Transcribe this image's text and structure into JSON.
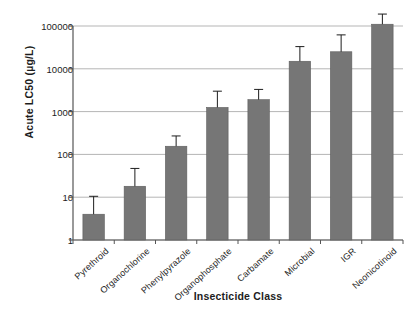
{
  "chart_data": {
    "type": "bar",
    "title": "",
    "xlabel": "Insecticide Class",
    "ylabel": "Acute LC50 (µg/L)",
    "yscale": "log",
    "ylim": [
      1,
      100000
    ],
    "ytick_labels": [
      "1",
      "10",
      "100",
      "1000",
      "10000",
      "100000"
    ],
    "ytick_values": [
      1,
      10,
      100,
      1000,
      10000,
      100000
    ],
    "grid": "horizontal",
    "legend": "none",
    "bar_color": "#767676",
    "categories": [
      "Pyrethroid",
      "Organochlorine",
      "Phenylpyrazole",
      "Organophosphate",
      "Carbamate",
      "Microbial",
      "IGR",
      "Neonicotinoid"
    ],
    "values": [
      4,
      18,
      155,
      1250,
      1900,
      15000,
      25000,
      110000
    ],
    "error_upper": [
      10.5,
      47,
      270,
      3000,
      3300,
      33000,
      62000,
      190000
    ],
    "series": [
      {
        "name": "Acute LC50",
        "values": [
          4,
          18,
          155,
          1250,
          1900,
          15000,
          25000,
          110000
        ],
        "error_upper": [
          10.5,
          47,
          270,
          3000,
          3300,
          33000,
          62000,
          190000
        ]
      }
    ]
  },
  "axes": {
    "y_title": "Acute LC50 (µg/L)",
    "x_title": "Insecticide Class"
  },
  "colors": {
    "bar_fill": "#767676",
    "bar_edge": "#5d5d5d",
    "grid": "#b5b5b5",
    "axis": "#555555",
    "text": "#1d1d1d"
  }
}
